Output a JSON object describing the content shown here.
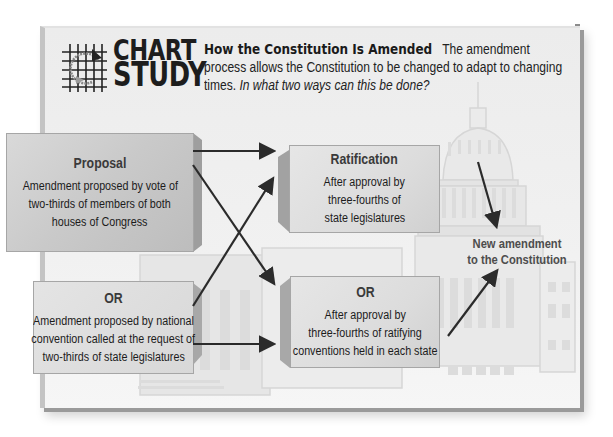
{
  "header": {
    "logo_line1": "CHART",
    "logo_line2": "STUDY",
    "title": "How the Constitution Is Amended",
    "description": "The amendment process allows the Constitution to be changed to adapt to changing times.",
    "question": "In what two ways can this be done?"
  },
  "proposal": {
    "method1": {
      "heading": "Proposal",
      "lines": [
        "Amendment proposed by vote of",
        "two-thirds of members of both",
        "houses of Congress"
      ]
    },
    "method2": {
      "heading": "OR",
      "lines": [
        "Amendment proposed by national",
        "convention called at the request of",
        "two-thirds of state legislatures"
      ]
    }
  },
  "ratification": {
    "method1": {
      "heading": "Ratification",
      "lines": [
        "After approval by",
        "three-fourths of",
        "state legislatures"
      ]
    },
    "method2": {
      "heading": "OR",
      "lines": [
        "After approval by",
        "three-fourths of ratifying",
        "conventions held in each state"
      ]
    }
  },
  "result": {
    "line1": "New amendment",
    "line2": "to the Constitution"
  },
  "flow": [
    {
      "from": "Proposal (Congress)",
      "to": "Ratification (state legislatures)"
    },
    {
      "from": "Proposal (Congress)",
      "to": "Ratification (state conventions)"
    },
    {
      "from": "Proposal (national convention)",
      "to": "Ratification (state legislatures)"
    },
    {
      "from": "Proposal (national convention)",
      "to": "Ratification (state conventions)"
    },
    {
      "from": "Ratification (state legislatures)",
      "to": "New amendment to the Constitution"
    },
    {
      "from": "Ratification (state conventions)",
      "to": "New amendment to the Constitution"
    }
  ],
  "colors": {
    "panel_bg": "#efefef",
    "box_left": "#c9c9c9",
    "box_right": "#dcdcdc",
    "arrow": "#2b2b2b",
    "text": "#1c1c1c",
    "result_text": "#4d4d4d"
  }
}
